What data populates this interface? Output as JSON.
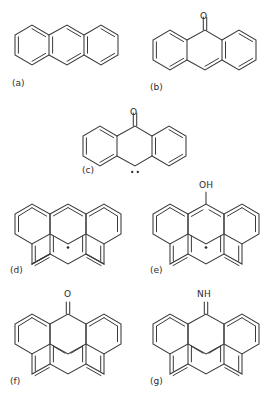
{
  "figure": {
    "type": "chemical-structure-panel",
    "background": "#ffffff",
    "bond_color": "#3a3a3a",
    "text_color": "#2b2b2b",
    "panel_count": 7
  },
  "panels": [
    {
      "id": "a",
      "label": "(a)",
      "name": "anthracene",
      "skeleton": "anthracene-3-ring-linear",
      "substituents": [],
      "radical": false
    },
    {
      "id": "b",
      "label": "(b)",
      "name": "anthrone-9-one",
      "skeleton": "anthracene-3-ring-linear",
      "substituents": [
        {
          "atom": "O",
          "bond": "double",
          "position": "top-center"
        }
      ],
      "radical": false
    },
    {
      "id": "c",
      "label": "(c)",
      "name": "anthrone-10-carbene",
      "skeleton": "anthracene-3-ring-linear",
      "substituents": [
        {
          "atom": "O",
          "bond": "double",
          "position": "top-center"
        }
      ],
      "radical": "carbene-two-dots-bottom-center"
    },
    {
      "id": "d",
      "label": "(d)",
      "name": "pah-radical",
      "skeleton": "benzopyrene-6-ring",
      "substituents": [],
      "radical": "single-dot-bottom-center"
    },
    {
      "id": "e",
      "label": "(e)",
      "name": "pah-hydroxyl-radical",
      "skeleton": "benzopyrene-6-ring",
      "substituents": [
        {
          "atom": "OH",
          "bond": "single",
          "position": "top-center"
        }
      ],
      "radical": "single-dot-bottom-center"
    },
    {
      "id": "f",
      "label": "(f)",
      "name": "pah-ketone",
      "skeleton": "benzopyrene-6-ring",
      "substituents": [
        {
          "atom": "O",
          "bond": "double",
          "position": "top-center"
        }
      ],
      "radical": false
    },
    {
      "id": "g",
      "label": "(g)",
      "name": "pah-imine",
      "skeleton": "benzopyrene-6-ring",
      "substituents": [
        {
          "atom": "NH",
          "bond": "double",
          "position": "top-center"
        }
      ],
      "radical": false
    }
  ],
  "atom_labels": {
    "oxygen": "O",
    "hydroxyl": "OH",
    "imine": "NH"
  }
}
